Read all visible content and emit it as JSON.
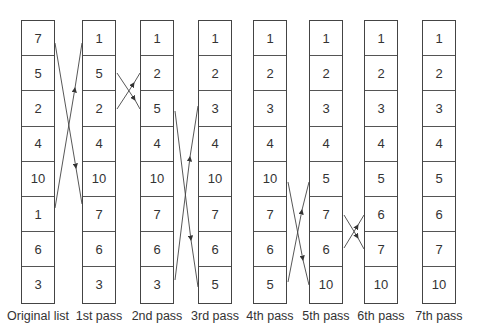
{
  "columns": [
    {
      "label": "Original list",
      "values": [
        "7",
        "5",
        "2",
        "4",
        "10",
        "1",
        "6",
        "3"
      ]
    },
    {
      "label": "1st pass",
      "values": [
        "1",
        "5",
        "2",
        "4",
        "10",
        "7",
        "6",
        "3"
      ]
    },
    {
      "label": "2nd pass",
      "values": [
        "1",
        "2",
        "5",
        "4",
        "10",
        "7",
        "6",
        "3"
      ]
    },
    {
      "label": "3rd pass",
      "values": [
        "1",
        "2",
        "3",
        "4",
        "10",
        "7",
        "6",
        "5"
      ]
    },
    {
      "label": "4th pass",
      "values": [
        "1",
        "2",
        "3",
        "4",
        "10",
        "7",
        "6",
        "5"
      ]
    },
    {
      "label": "5th pass",
      "values": [
        "1",
        "2",
        "3",
        "4",
        "5",
        "7",
        "6",
        "10"
      ]
    },
    {
      "label": "6th pass",
      "values": [
        "1",
        "2",
        "3",
        "4",
        "5",
        "6",
        "7",
        "10"
      ]
    },
    {
      "label": "7th pass",
      "values": [
        "1",
        "2",
        "3",
        "4",
        "5",
        "6",
        "7",
        "10"
      ]
    }
  ],
  "swaps": [
    {
      "from_col": 0,
      "rows": [
        0,
        5
      ]
    },
    {
      "from_col": 1,
      "rows": [
        1,
        2
      ]
    },
    {
      "from_col": 2,
      "rows": [
        2,
        7
      ]
    },
    {
      "from_col": 4,
      "rows": [
        4,
        7
      ]
    },
    {
      "from_col": 5,
      "rows": [
        5,
        6
      ]
    }
  ]
}
